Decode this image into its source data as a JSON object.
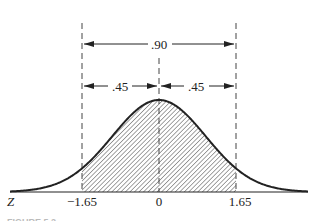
{
  "figure": {
    "type": "standard-normal-distribution",
    "axis_variable": "Z",
    "tick_labels": [
      "-1.65",
      "0",
      "1.65"
    ],
    "tick_values": [
      -1.65,
      0,
      1.65
    ],
    "total_area_label": ".90",
    "left_half_area_label": ".45",
    "right_half_area_label": ".45",
    "shaded_region": {
      "from": -1.65,
      "to": 1.65
    },
    "caption_partial": "FIGURE 5.2"
  },
  "labels": {
    "z": "Z",
    "neg_tick": "−1.65",
    "zero_tick": "0",
    "pos_tick": "1.65",
    "total": ".90",
    "left": ".45",
    "right": ".45",
    "caption": "FIGURE 5.2"
  },
  "colors": {
    "ink": "#222222",
    "dash": "#444444",
    "background": "#ffffff"
  }
}
